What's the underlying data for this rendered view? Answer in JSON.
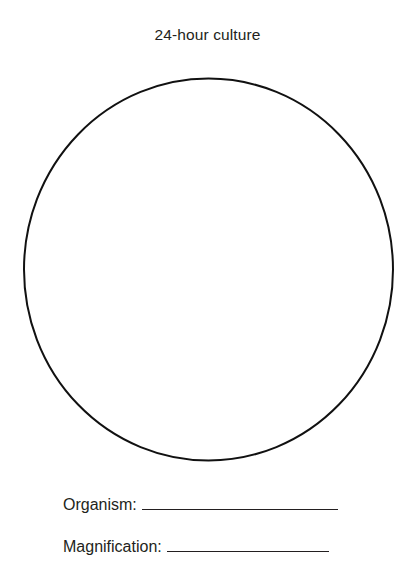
{
  "title": "24-hour culture",
  "diagram": {
    "shape": "circle",
    "stroke_color": "#111111"
  },
  "fields": [
    {
      "label": "Organism:",
      "value": ""
    },
    {
      "label": "Magnification:",
      "value": ""
    }
  ]
}
